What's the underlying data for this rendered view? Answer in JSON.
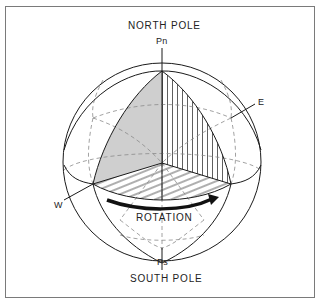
{
  "figure": {
    "title_top": "NORTH POLE",
    "title_bottom": "SOUTH POLE",
    "labels": {
      "north_pole_point": "Pn",
      "south_pole_point": "Ps",
      "east": "E",
      "west": "W",
      "rotation": "ROTATION"
    },
    "colors": {
      "line": "#1a1a1a",
      "dashed": "#8a8a8a",
      "shaded_fill": "#cfcfcf",
      "frame": "#7a7a7a",
      "background": "#ffffff"
    }
  }
}
